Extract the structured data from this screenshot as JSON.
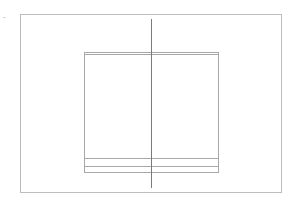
{
  "diagram": {
    "type": "line-drawing",
    "canvas": {
      "width": 297,
      "height": 204,
      "background": "#ffffff"
    },
    "colors": {
      "frame_stroke": "#bdbdbd",
      "inner_stroke": "#a8a8a8",
      "center_line": "#7a7a7a",
      "faint_mark": "#d6d6d6"
    },
    "outer_frame": {
      "x": 20,
      "y": 14,
      "width": 261,
      "height": 178
    },
    "inner_box": {
      "x": 84,
      "y": 52,
      "width": 134,
      "height": 120,
      "top_double_line_offset": 2,
      "bottom_bands_y": [
        158,
        166
      ]
    },
    "center_line": {
      "x": 151,
      "y1": 19,
      "y2": 188
    },
    "corner_mark": {
      "x": 3,
      "y": 17
    }
  }
}
